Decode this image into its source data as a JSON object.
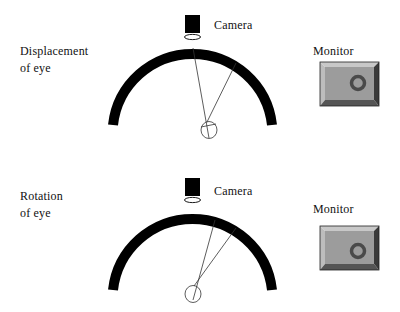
{
  "panels": [
    {
      "id": "displacement",
      "label_line1": "Displacement",
      "label_line2": "of eye",
      "camera_label": "Camera",
      "monitor_label": "Monitor"
    },
    {
      "id": "rotation",
      "label_line1": "Rotation",
      "label_line2": "of eye",
      "camera_label": "Camera",
      "monitor_label": "Monitor"
    }
  ],
  "colors": {
    "arch": "#000000",
    "monitor_face": "#999999",
    "monitor_bevel_light": "#c8c8c8",
    "monitor_bevel_dark": "#4a4a4a",
    "pupil_ring": "#555555"
  },
  "icons": [
    "camera-icon",
    "lens-icon",
    "eye-icon",
    "monitor-icon"
  ]
}
